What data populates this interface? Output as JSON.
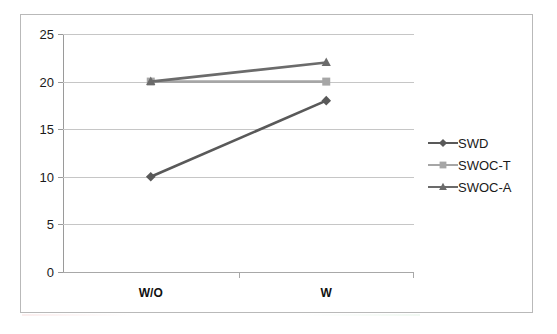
{
  "chart_data": {
    "type": "line",
    "title": "",
    "subtitle": "",
    "xlabel": "",
    "ylabel": "",
    "categories": [
      "W/O",
      "W"
    ],
    "series": [
      {
        "name": "SWD",
        "values": [
          10,
          18
        ],
        "color": "#595959",
        "marker": "diamond"
      },
      {
        "name": "SWOC-T",
        "values": [
          20,
          20
        ],
        "color": "#a6a6a6",
        "marker": "square"
      },
      {
        "name": "SWOC-A",
        "values": [
          20,
          22
        ],
        "color": "#6b6b6b",
        "marker": "triangle"
      }
    ],
    "ylim": [
      0,
      25
    ],
    "ytick_interval": 5,
    "yticks": [
      "0",
      "5",
      "10",
      "15",
      "20",
      "25"
    ],
    "grid": true,
    "grid_axis": "y",
    "legend_position": "right"
  },
  "axes": {
    "y": {
      "ticks": [
        {
          "value": 25,
          "label": "25"
        },
        {
          "value": 20,
          "label": "20"
        },
        {
          "value": 15,
          "label": "15"
        },
        {
          "value": 10,
          "label": "10"
        },
        {
          "value": 5,
          "label": "5"
        },
        {
          "value": 0,
          "label": "0"
        }
      ]
    },
    "x": {
      "categories": [
        {
          "label": "W/O"
        },
        {
          "label": "W"
        }
      ]
    }
  },
  "legend": {
    "items": [
      {
        "label": "SWD",
        "marker": "diamond-marker",
        "color": "#595959"
      },
      {
        "label": "SWOC-T",
        "marker": "square-marker",
        "color": "#a6a6a6"
      },
      {
        "label": "SWOC-A",
        "marker": "triangle-marker",
        "color": "#6b6b6b"
      }
    ]
  },
  "colors": {
    "gridline": "#c6c6c6",
    "axis": "#9a9a9a",
    "frame": "#b9b9b9",
    "background": "#ffffff",
    "text": "#1a1a1a"
  }
}
